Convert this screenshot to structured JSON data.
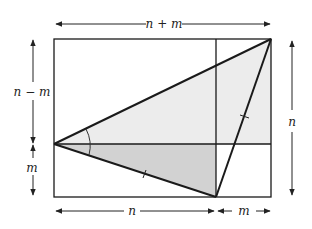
{
  "diagram": {
    "labels": {
      "top": "n + m",
      "left_upper": "n − m",
      "left_lower": "m",
      "right": "n",
      "bottom_left": "n",
      "bottom_right": "m"
    },
    "colors": {
      "stroke": "#1a1a1a",
      "light_fill": "#ececec",
      "dark_fill": "#d2d2d2",
      "arrow": "#222222"
    }
  }
}
